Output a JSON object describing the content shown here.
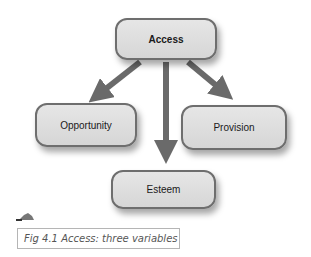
{
  "diagram": {
    "nodes": {
      "access": {
        "label": "Access"
      },
      "opportunity": {
        "label": "Opportunity"
      },
      "provision": {
        "label": "Provision"
      },
      "esteem": {
        "label": "Esteem"
      }
    },
    "edges": [
      {
        "from": "Access",
        "to": "Opportunity"
      },
      {
        "from": "Access",
        "to": "Esteem"
      },
      {
        "from": "Access",
        "to": "Provision"
      }
    ],
    "colors": {
      "node_fill": "#dcdcdc",
      "node_border": "#6e6e6e",
      "arrow": "#666666"
    }
  },
  "caption": {
    "label": "Fig 4.1",
    "text": "Access: three variables",
    "full": "Fig 4.1 Access: three variables"
  }
}
